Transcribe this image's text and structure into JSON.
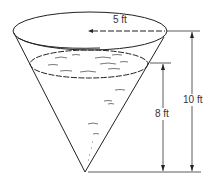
{
  "diagram": {
    "labels": {
      "radius": "5 ft",
      "water_depth": "8 ft",
      "tank_height": "10 ft"
    },
    "colors": {
      "stroke": "#222222",
      "dimension": "#333333",
      "water_mark": "#555555"
    }
  }
}
